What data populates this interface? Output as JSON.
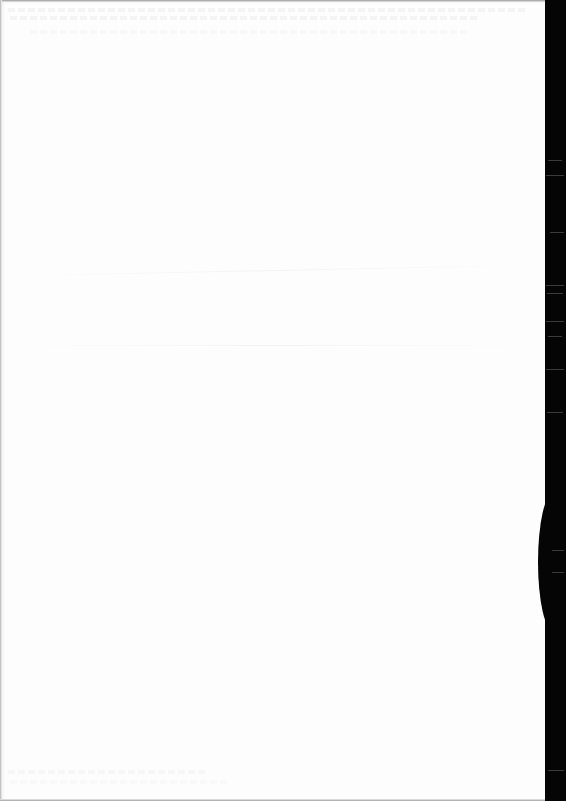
{
  "document": {
    "type": "scanned-page",
    "content": "blank",
    "colors": {
      "paper": "#fdfdfd",
      "scanner_background": "#050505",
      "edge_shadow": "#9a9a9a"
    },
    "page_width_px": 545,
    "scanner_strip_width_px": 21
  }
}
